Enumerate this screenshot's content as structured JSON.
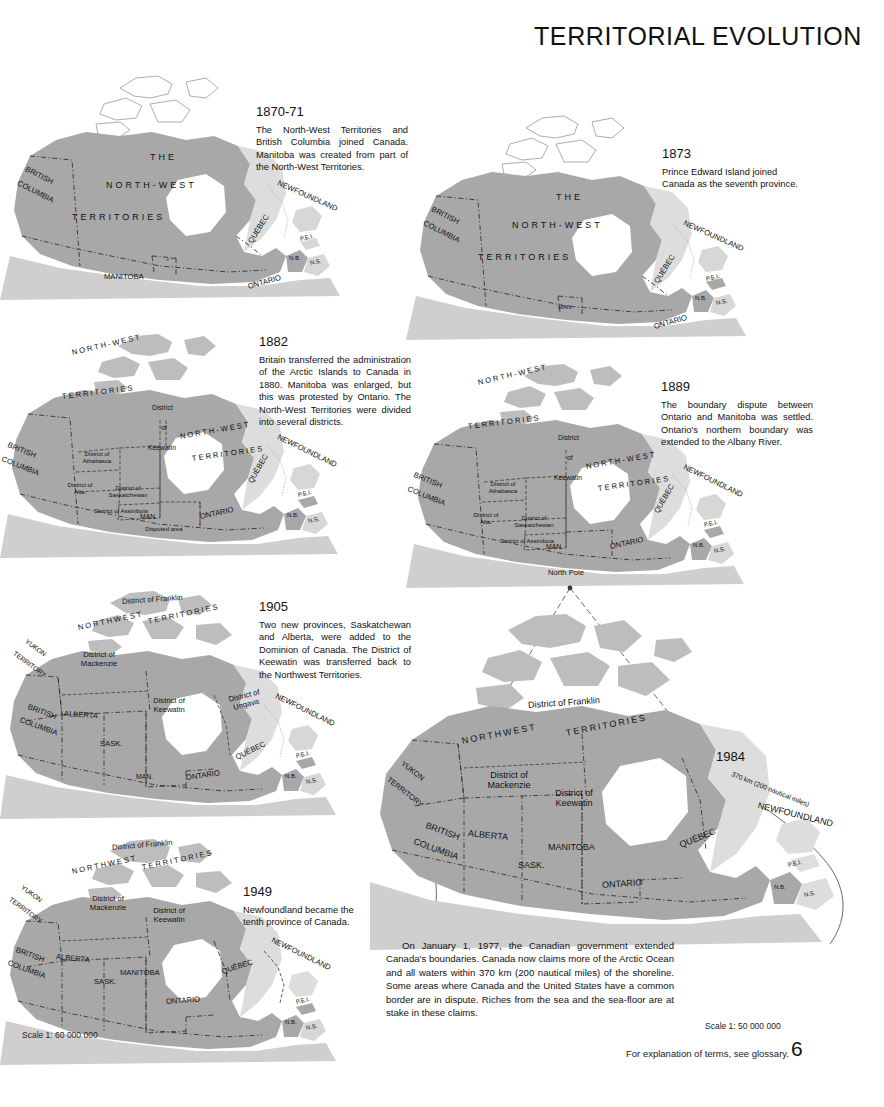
{
  "page": {
    "title": "TERRITORIAL EVOLUTION",
    "footer_note": "For explanation of terms, see glossary.",
    "page_number": "6",
    "scale_left": "Scale 1: 60 000 000",
    "scale_right": "Scale 1: 50 000 000"
  },
  "captions": {
    "m1870": {
      "year": "1870-71",
      "body": "The North-West Territories and British Columbia joined Canada. Manitoba was created from part of the North-West Territories."
    },
    "m1873": {
      "year": "1873",
      "body": "Prince Edward Island joined Canada as the seventh province."
    },
    "m1882": {
      "year": "1882",
      "body": "Britain transferred the administration of the Arctic Islands to Canada in 1880. Manitoba was enlarged, but this was protested by Ontario. The North-West Territories were divided into several districts."
    },
    "m1889": {
      "year": "1889",
      "body": "The boundary dispute between Ontario and Manitoba was settled. Ontario's northern boundary was extended to the Albany River."
    },
    "m1905": {
      "year": "1905",
      "body": "Two new provinces, Saskatchewan and Alberta, were added to the Dominion of Canada. The District of Keewatin was transferred back to the Northwest Territories."
    },
    "m1949": {
      "year": "1949",
      "body": "Newfoundland became the tenth province of Canada."
    },
    "m1984": {
      "year": "1984",
      "body": "On January 1, 1977, the Canadian government extended Canada's boundaries. Canada now claims more of the Arctic Ocean and all waters within 370 km (200 nautical miles) of the shoreline. Some areas where Canada and the United States have a common border are in dispute. Riches from the sea and the sea-floor are at stake in these claims."
    }
  },
  "maps": {
    "m1870": {
      "labels": {
        "the": "THE",
        "north_west": "NORTH-WEST",
        "territories": "TERRITORIES",
        "british_columbia_1": "BRITISH",
        "british_columbia_2": "COLUMBIA",
        "manitoba": "MANITOBA",
        "ontario": "ONTARIO",
        "quebec": "QUÉBEC",
        "newfoundland": "NEWFOUNDLAND",
        "pei": "P.E.I.",
        "nb": "N.B.",
        "ns": "N.S."
      }
    },
    "m1873": {
      "labels": {
        "the": "THE",
        "north_west": "NORTH-WEST",
        "territories": "TERRITORIES",
        "british_columbia_1": "BRITISH",
        "british_columbia_2": "COLUMBIA",
        "manitoba": "MAN.",
        "ontario": "ONTARIO",
        "quebec": "QUÉBEC",
        "newfoundland": "NEWFOUNDLAND",
        "pei": "P.E.I.",
        "nb": "N.B.",
        "ns": "N.S."
      }
    },
    "m1882": {
      "labels": {
        "north_west": "NORTH-WEST",
        "territories": "TERRITORIES",
        "north_west_2": "NORTH-WEST",
        "territories_2": "TERRITORIES",
        "district": "District",
        "of": "of",
        "keewatin": "Keewatin",
        "d_athabasca": "District of Athabasca",
        "d_alta": "District of Alta.",
        "d_saskatchewan": "District of Saskatchewan",
        "d_assiniboia": "District of Assiniboia",
        "british_columbia_1": "BRITISH",
        "british_columbia_2": "COLUMBIA",
        "manitoba": "MAN.",
        "disputed_area": "Disputed area",
        "ontario": "ONTARIO",
        "quebec": "QUÉBEC",
        "newfoundland": "NEWFOUNDLAND",
        "pei": "P.E.I.",
        "nb": "N.B.",
        "ns": "N.S."
      }
    },
    "m1889": {
      "labels": {
        "north_west": "NORTH-WEST",
        "territories": "TERRITORIES",
        "north_west_2": "NORTH-WEST",
        "territories_2": "TERRITORIES",
        "district": "District",
        "of": "of",
        "keewatin": "Keewatin",
        "d_athabasca": "District of Athabasca",
        "d_alta": "District of Alta.",
        "d_saskatchewan": "District of Saskatchewan",
        "d_assiniboia": "District of Assiniboia",
        "british_columbia_1": "BRITISH",
        "british_columbia_2": "COLUMBIA",
        "manitoba": "MAN.",
        "ontario": "ONTARIO",
        "quebec": "QUÉBEC",
        "newfoundland": "NEWFOUNDLAND",
        "pei": "P.E.I.",
        "nb": "N.B.",
        "ns": "N.S."
      }
    },
    "m1905": {
      "labels": {
        "d_franklin": "District of Franklin",
        "northwest": "NORTHWEST",
        "territories": "TERRITORIES",
        "yukon_1": "YUKON",
        "yukon_2": "TERRITORY",
        "d_mackenzie": "District of Mackenzie",
        "d_keewatin": "District of Keewatin",
        "d_ungava": "District of Ungava",
        "british_columbia_1": "BRITISH",
        "british_columbia_2": "COLUMBIA",
        "alberta": "ALBERTA",
        "sask": "SASK.",
        "manitoba": "MAN.",
        "ontario": "ONTARIO",
        "quebec": "QUÉBEC",
        "newfoundland": "NEWFOUNDLAND",
        "pei": "P.E.I.",
        "nb": "N.B.",
        "ns": "N.S."
      }
    },
    "m1949": {
      "labels": {
        "d_franklin": "District of Franklin",
        "northwest": "NORTHWEST",
        "territories": "TERRITORIES",
        "yukon_1": "YUKON",
        "yukon_2": "TERRITORY",
        "d_mackenzie": "District of Mackenzie",
        "d_keewatin": "District of Keewatin",
        "british_columbia_1": "BRITISH",
        "british_columbia_2": "COLUMBIA",
        "alberta": "ALBERTA",
        "sask": "SASK.",
        "manitoba": "MANITOBA",
        "ontario": "ONTARIO",
        "quebec": "QUÉBEC",
        "newfoundland": "NEWFOUNDLAND",
        "pei": "P.E.I.",
        "nb": "N.B.",
        "ns": "N.S."
      }
    },
    "m1984": {
      "labels": {
        "north_pole": "North Pole",
        "d_franklin": "District of Franklin",
        "northwest": "NORTHWEST",
        "territories": "TERRITORIES",
        "yukon_1": "YUKON",
        "yukon_2": "TERRITORY",
        "d_mackenzie": "District of Mackenzie",
        "d_keewatin": "District of Keewatin",
        "british_columbia_1": "BRITISH",
        "british_columbia_2": "COLUMBIA",
        "alberta": "ALBERTA",
        "sask": "SASK.",
        "manitoba": "MANITOBA",
        "ontario": "ONTARIO",
        "quebec": "QUÉBEC",
        "newfoundland": "NEWFOUNDLAND",
        "limit": "370 km (200 nautical miles)",
        "pei": "P.E.I.",
        "nb": "N.B.",
        "ns": "N.S."
      }
    }
  }
}
